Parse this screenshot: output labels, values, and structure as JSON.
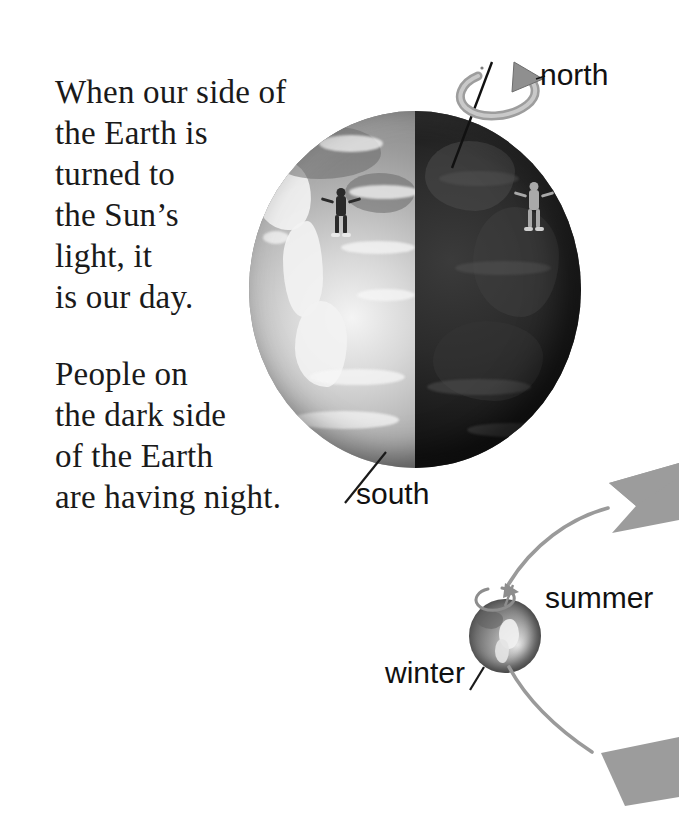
{
  "page": {
    "background_color": "#ffffff",
    "width": 679,
    "height": 836
  },
  "body_text": {
    "paragraph_day": "When our side of\nthe Earth is\nturned to\nthe Sun’s\nlight, it\nis our day.",
    "paragraph_night": "People on\nthe dark side\nof the Earth\nare having night."
  },
  "labels": {
    "north": "north",
    "south": "south",
    "summer": "summer",
    "winter": "winter"
  },
  "diagram": {
    "big_earth": {
      "name": "Earth",
      "lit_side": "left",
      "dark_side": "right",
      "lit_color": "#b6b6b6",
      "dark_color": "#1b1b1b",
      "axis": "tilted rotation axis through north and south poles",
      "rotation_arrow": "counter-clockwise curved arrow around north pole"
    },
    "people": [
      {
        "id": "person-day",
        "side": "lit",
        "color": "#2a2a2a"
      },
      {
        "id": "person-night",
        "side": "dark",
        "color": "#a9a9a9"
      }
    ],
    "small_earth": {
      "name": "Earth in orbit",
      "color": "#8a8a8a",
      "rotation_arrow": "small curved spin arrow at north pole"
    },
    "orbit": {
      "line_color": "#9a9a9a",
      "arrows": [
        {
          "id": "orbit-arrow-upper",
          "direction": "left",
          "color": "#9c9c9c"
        },
        {
          "id": "orbit-arrow-lower",
          "direction": "left",
          "color": "#9c9c9c"
        }
      ]
    },
    "leader_lines": [
      {
        "id": "leader-south",
        "from": "south label",
        "to": "south pole of Earth"
      },
      {
        "id": "leader-winter",
        "from": "winter label",
        "to": "small Earth"
      }
    ]
  }
}
